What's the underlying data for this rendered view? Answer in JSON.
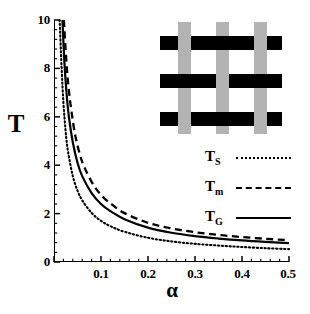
{
  "chart_data": {
    "type": "line",
    "title": "",
    "xlabel": "α",
    "ylabel": "T",
    "xlim": [
      0.0,
      0.5
    ],
    "ylim": [
      0,
      10
    ],
    "xticks": [
      0.1,
      0.2,
      0.3,
      0.4,
      0.5
    ],
    "xtick_labels": [
      "0.1",
      "0.2",
      "0.3",
      "0.4",
      "0.5"
    ],
    "yticks": [
      0,
      2,
      4,
      6,
      8,
      10
    ],
    "ytick_labels": [
      "0",
      "2",
      "4",
      "6",
      "8",
      "10"
    ],
    "x_minor_tick_step": 0.02,
    "y_minor_tick_step": 0.4,
    "grid": false,
    "legend_position": "right-middle",
    "series": [
      {
        "name": "T_S",
        "label": "T",
        "subscript": "S",
        "style": "dotted",
        "color": "#000000",
        "x": [
          0.012,
          0.016,
          0.02,
          0.025,
          0.03,
          0.04,
          0.05,
          0.06,
          0.08,
          0.1,
          0.12,
          0.15,
          0.2,
          0.25,
          0.3,
          0.35,
          0.4,
          0.45,
          0.5
        ],
        "y": [
          10.0,
          8.1,
          6.6,
          5.35,
          4.55,
          3.55,
          2.95,
          2.55,
          2.03,
          1.7,
          1.48,
          1.25,
          1.0,
          0.85,
          0.75,
          0.68,
          0.62,
          0.57,
          0.53
        ]
      },
      {
        "name": "T_G",
        "label": "T",
        "subscript": "G",
        "style": "solid",
        "color": "#000000",
        "x": [
          0.018,
          0.022,
          0.027,
          0.032,
          0.04,
          0.05,
          0.06,
          0.08,
          0.1,
          0.12,
          0.15,
          0.2,
          0.25,
          0.3,
          0.35,
          0.4,
          0.45,
          0.5
        ],
        "y": [
          10.0,
          8.3,
          6.9,
          5.95,
          4.95,
          4.1,
          3.55,
          2.85,
          2.4,
          2.1,
          1.77,
          1.42,
          1.21,
          1.07,
          0.97,
          0.89,
          0.83,
          0.78
        ]
      },
      {
        "name": "T_m",
        "label": "T",
        "subscript": "m",
        "style": "dashed",
        "color": "#000000",
        "x": [
          0.021,
          0.026,
          0.031,
          0.037,
          0.045,
          0.055,
          0.065,
          0.085,
          0.105,
          0.125,
          0.15,
          0.2,
          0.25,
          0.3,
          0.35,
          0.4,
          0.45,
          0.5
        ],
        "y": [
          10.0,
          8.4,
          7.2,
          6.25,
          5.25,
          4.45,
          3.9,
          3.15,
          2.67,
          2.35,
          2.02,
          1.62,
          1.39,
          1.23,
          1.12,
          1.03,
          0.96,
          0.9
        ]
      }
    ]
  },
  "inset": {
    "name": "woven-lattice-diagram",
    "description": "woven lattice of black horizontal bars over gray vertical bars",
    "horizontal_bar_color": "#000000",
    "vertical_bar_color": "#b3b3b3",
    "rows": 3,
    "columns": 3
  },
  "legend": {
    "items": [
      {
        "label": "T",
        "subscript": "S",
        "style": "dotted"
      },
      {
        "label": "T",
        "subscript": "m",
        "style": "dashed"
      },
      {
        "label": "T",
        "subscript": "G",
        "style": "solid"
      }
    ]
  },
  "axes": {
    "y_title": "T",
    "x_title": "α"
  }
}
